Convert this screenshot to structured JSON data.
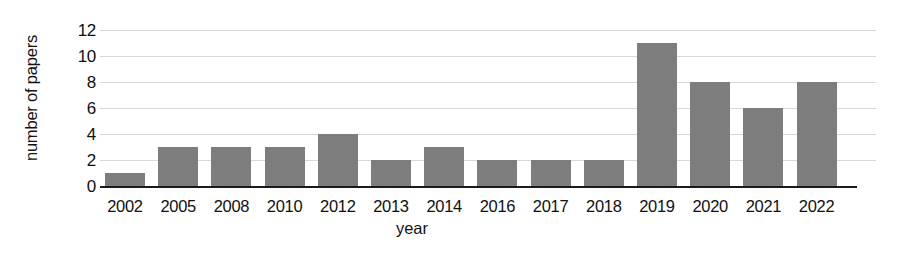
{
  "chart_data": {
    "type": "bar",
    "title": "",
    "xlabel": "year",
    "ylabel": "number of papers",
    "categories": [
      "2002",
      "2005",
      "2008",
      "2010",
      "2012",
      "2013",
      "2014",
      "2016",
      "2017",
      "2018",
      "2019",
      "2020",
      "2021",
      "2022"
    ],
    "values": [
      1,
      3,
      3,
      3,
      4,
      2,
      3,
      2,
      2,
      2,
      11,
      8,
      6,
      8
    ],
    "series": [
      {
        "name": "number of papers",
        "values": [
          1,
          3,
          3,
          3,
          4,
          2,
          3,
          2,
          2,
          2,
          11,
          8,
          6,
          8
        ]
      }
    ],
    "ylim": [
      0,
      12
    ],
    "yticks": [
      0,
      2,
      4,
      6,
      8,
      10,
      12
    ],
    "ytick_labels": [
      "0",
      "2",
      "4",
      "6",
      "8",
      "10",
      "12"
    ],
    "grid": true,
    "grid_axis": "y",
    "legend": false,
    "legend_position": "none",
    "bar_color": "#7d7d7d",
    "gridline_color": "#cfcfcf",
    "axis_color": "#1a1a1a",
    "background_color": "#ffffff"
  }
}
